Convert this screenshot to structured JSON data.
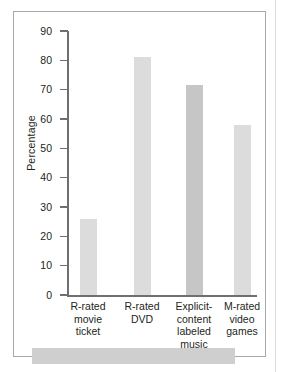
{
  "chart_data": {
    "type": "bar",
    "title": "",
    "xlabel": "",
    "ylabel": "Percentage",
    "ylim": [
      0,
      90
    ],
    "ytick_step": 10,
    "yticks": [
      90,
      80,
      70,
      60,
      50,
      40,
      30,
      20,
      10,
      0
    ],
    "grid": false,
    "legend": false,
    "categories": [
      "R-rated movie ticket",
      "R-rated DVD",
      "Explicit-content labeled music",
      "M-rated video games"
    ],
    "category_lines": [
      [
        "R-rated",
        "movie",
        "ticket"
      ],
      [
        "R-rated",
        "DVD"
      ],
      [
        "Explicit-",
        "content",
        "labeled",
        "music"
      ],
      [
        "M-rated",
        "video",
        "games"
      ]
    ],
    "values": [
      26,
      81,
      71.5,
      58
    ],
    "bar_colors": [
      "#dcdcdc",
      "#dcdcdc",
      "#c6c6c6",
      "#dcdcdc"
    ]
  },
  "axes": {
    "y_title": "Percentage"
  },
  "colors": {
    "frame": "#a8a8ac",
    "axis": "#6f6f73",
    "text": "#231f20",
    "bar_light": "#dcdcdc",
    "bar_dark": "#c6c6c6",
    "band": "#cfcfcf"
  }
}
